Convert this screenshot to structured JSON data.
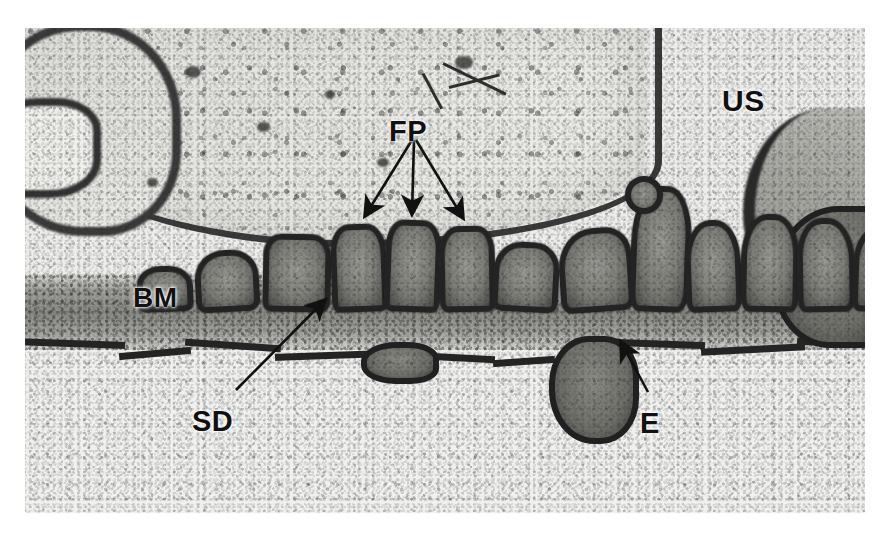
{
  "figure": {
    "kind": "transmission-electron-micrograph",
    "background_color": "#ffffff",
    "plate_tone": "grayscale"
  },
  "annotations": {
    "labels": [
      {
        "id": "us",
        "text": "US",
        "meaning": "urinary space",
        "x": 722,
        "y": 86,
        "font_size": 30,
        "color": "#111111",
        "has_arrow": false
      },
      {
        "id": "fp",
        "text": "FP",
        "meaning": "foot processes",
        "x": 389,
        "y": 117,
        "font_size": 29,
        "color": "#111111",
        "has_arrow": true,
        "arrow_count": 3
      },
      {
        "id": "bm",
        "text": "BM",
        "meaning": "basement membrane",
        "x": 133,
        "y": 284,
        "font_size": 28,
        "color": "#111111",
        "has_arrow": false
      },
      {
        "id": "sd",
        "text": "SD",
        "meaning": "slit diaphragm",
        "x": 192,
        "y": 407,
        "font_size": 29,
        "color": "#111111",
        "has_arrow": true,
        "arrow_count": 1
      },
      {
        "id": "e",
        "text": "E",
        "meaning": "endothelium",
        "x": 640,
        "y": 409,
        "font_size": 29,
        "color": "#111111",
        "has_arrow": true,
        "arrow_count": 1
      }
    ],
    "arrows": [
      {
        "id": "fp-arrow-left",
        "from": [
          412,
          140
        ],
        "to": [
          365,
          216
        ]
      },
      {
        "id": "fp-arrow-middle",
        "from": [
          414,
          140
        ],
        "to": [
          412,
          214
        ]
      },
      {
        "id": "fp-arrow-right",
        "from": [
          416,
          140
        ],
        "to": [
          463,
          218
        ]
      },
      {
        "id": "sd-arrow",
        "from": [
          236,
          390
        ],
        "to": [
          325,
          300
        ]
      },
      {
        "id": "e-arrow",
        "from": [
          648,
          392
        ],
        "to": [
          621,
          342
        ]
      }
    ]
  },
  "structures": {
    "urinary_space": {
      "label_ref": "us",
      "region": "upper-right pale area"
    },
    "podocyte_cell_body": {
      "region": "upper-left granular cell"
    },
    "foot_processes": {
      "label_ref": "fp",
      "count_visible": 14
    },
    "basement_membrane": {
      "label_ref": "bm",
      "region": "horizontal gray band"
    },
    "slit_diaphragm": {
      "label_ref": "sd",
      "region": "gap between foot processes"
    },
    "endothelium": {
      "label_ref": "e",
      "region": "thin dark layer below BM"
    },
    "capillary_lumen": {
      "region": "lower pale area"
    }
  },
  "foot_process_shapes": [
    {
      "left": 170,
      "top": 222,
      "width": 52,
      "height": 50,
      "radius": "46% 42% 18% 16%",
      "rot": -3
    },
    {
      "left": 238,
      "top": 206,
      "width": 56,
      "height": 66,
      "radius": "26% 28% 14% 12%",
      "rot": 1
    },
    {
      "left": 306,
      "top": 196,
      "width": 44,
      "height": 76,
      "radius": "32% 34% 12% 12%",
      "rot": -2
    },
    {
      "left": 360,
      "top": 192,
      "width": 44,
      "height": 80,
      "radius": "30% 32% 12% 12%",
      "rot": 2
    },
    {
      "left": 414,
      "top": 198,
      "width": 44,
      "height": 74,
      "radius": "34% 30% 12% 14%",
      "rot": -1
    },
    {
      "left": 468,
      "top": 214,
      "width": 54,
      "height": 58,
      "radius": "42% 38% 14% 14%",
      "rot": 3
    },
    {
      "left": 534,
      "top": 200,
      "width": 62,
      "height": 72,
      "radius": "48% 34% 16% 14%",
      "rot": -4
    },
    {
      "left": 606,
      "top": 158,
      "width": 48,
      "height": 114,
      "radius": "44% 40% 20% 16%",
      "rot": 2
    },
    {
      "left": 660,
      "top": 192,
      "width": 44,
      "height": 80,
      "radius": "46% 44% 14% 14%",
      "rot": -2
    },
    {
      "left": 716,
      "top": 186,
      "width": 46,
      "height": 86,
      "radius": "44% 42% 14% 16%",
      "rot": 1
    },
    {
      "left": 772,
      "top": 190,
      "width": 46,
      "height": 82,
      "radius": "42% 46% 16% 14%",
      "rot": -1
    },
    {
      "left": 828,
      "top": 198,
      "width": 44,
      "height": 74,
      "radius": "44% 40% 14% 14%",
      "rot": 2
    },
    {
      "left": 112,
      "top": 238,
      "width": 44,
      "height": 34,
      "radius": "40% 44% 16% 16%",
      "rot": -2
    },
    {
      "left": 600,
      "top": 148,
      "width": 26,
      "height": 26,
      "radius": "50%",
      "rot": 0
    }
  ]
}
